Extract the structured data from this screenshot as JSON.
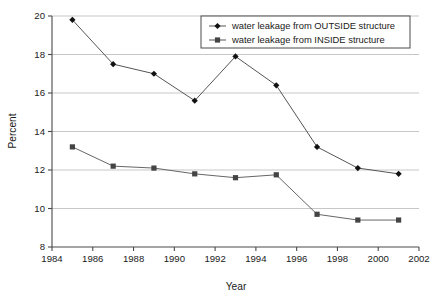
{
  "chart_data": {
    "type": "line",
    "title": "",
    "xlabel": "Year",
    "ylabel": "Percent",
    "xlim": [
      1984,
      2002
    ],
    "ylim": [
      8,
      20
    ],
    "xticks": [
      1984,
      1986,
      1988,
      1990,
      1992,
      1994,
      1996,
      1998,
      2000,
      2002
    ],
    "yticks": [
      8,
      10,
      12,
      14,
      16,
      18,
      20
    ],
    "xtick_labels": [
      "1984",
      "1986",
      "1988",
      "1990",
      "1992",
      "1994",
      "1996",
      "1998",
      "2000",
      "2002"
    ],
    "ytick_labels": [
      "8",
      "10",
      "12",
      "14",
      "16",
      "18",
      "20"
    ],
    "grid": "horizontal",
    "legend_position": "top-right",
    "x": [
      1985,
      1987,
      1989,
      1991,
      1993,
      1995,
      1997,
      1999,
      2001
    ],
    "series": [
      {
        "name": "water leakage from OUTSIDE structure",
        "marker": "diamond",
        "color": "#111111",
        "values": [
          19.8,
          17.5,
          17.0,
          15.6,
          17.9,
          16.4,
          13.2,
          12.1,
          11.8
        ]
      },
      {
        "name": "water leakage from INSIDE structure",
        "marker": "square",
        "color": "#444444",
        "values": [
          13.2,
          12.2,
          12.1,
          11.8,
          11.6,
          11.75,
          9.7,
          9.4,
          9.4
        ]
      }
    ]
  },
  "legend": {
    "entries": [
      {
        "label": "water leakage from OUTSIDE structure",
        "marker": "diamond-marker-icon"
      },
      {
        "label": "water leakage from INSIDE structure",
        "marker": "square-marker-icon"
      }
    ]
  },
  "colors": {
    "gridline": "#b9b9b9",
    "axis": "#4a4a4a",
    "series_outside": "#111111",
    "series_inside": "#444444",
    "background": "#ffffff"
  }
}
